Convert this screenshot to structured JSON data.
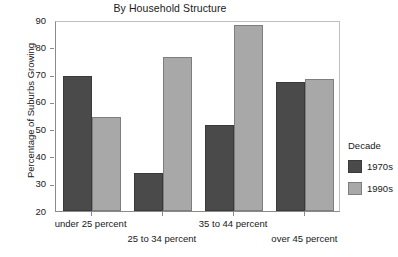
{
  "chart_data": {
    "type": "bar",
    "title": "By Household Structure",
    "xlabel": "",
    "ylabel": "Percentage of Suburbs Growing",
    "ylim": [
      20,
      90
    ],
    "yticks": [
      20,
      30,
      40,
      50,
      60,
      70,
      80,
      90
    ],
    "grid": false,
    "legend_position": "right",
    "legend_title": "Decade",
    "categories": [
      "under 25 percent",
      "25 to 34 percent",
      "35 to 44 percent",
      "over 45 percent"
    ],
    "series": [
      {
        "name": "1970s",
        "color": "#4a4a4a",
        "values": [
          69.5,
          34.0,
          51.5,
          67.3
        ]
      },
      {
        "name": "1990s",
        "color": "#a8a8a8",
        "values": [
          54.5,
          76.5,
          88.3,
          68.2
        ]
      }
    ]
  }
}
